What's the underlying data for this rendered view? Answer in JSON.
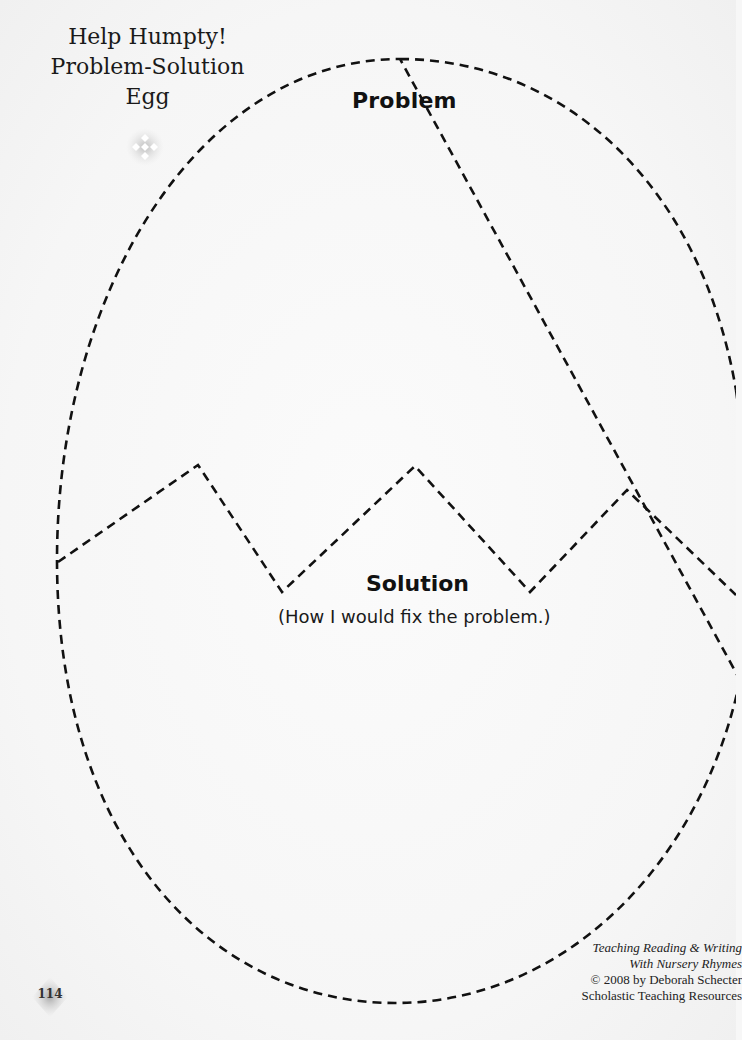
{
  "title": {
    "line1": "Help Humpty!",
    "line2": "Problem-Solution",
    "line3": "Egg"
  },
  "sections": {
    "problem": {
      "heading": "Problem"
    },
    "solution": {
      "heading": "Solution",
      "subheading": "(How I would fix the problem.)"
    }
  },
  "credits": {
    "line1": "Teaching Reading & Writing",
    "line2": "With Nursery Rhymes",
    "line3": "© 2008 by Deborah Schecter",
    "line4": "Scholastic Teaching Resources"
  },
  "footer": {
    "page_number": "114"
  },
  "colors": {
    "outline": "#111111",
    "background": "#f7f7f7",
    "ornament": "#c8c8c8"
  },
  "icons": {
    "title_ornament": "diamond-cluster-icon",
    "page_badge": "diamond-badge-icon"
  }
}
